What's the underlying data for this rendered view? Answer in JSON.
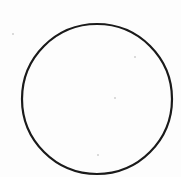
{
  "diagram": {
    "background": "#ffffff",
    "shapes": [
      {
        "type": "circle",
        "cx": 97,
        "cy": 99,
        "r": 75,
        "stroke": "#1a1a1a",
        "stroke_width": 2.2,
        "fill": "none"
      }
    ],
    "specks": [
      {
        "x": 134,
        "y": 56
      },
      {
        "x": 114,
        "y": 97
      },
      {
        "x": 97,
        "y": 154
      },
      {
        "x": 12,
        "y": 33
      }
    ]
  }
}
